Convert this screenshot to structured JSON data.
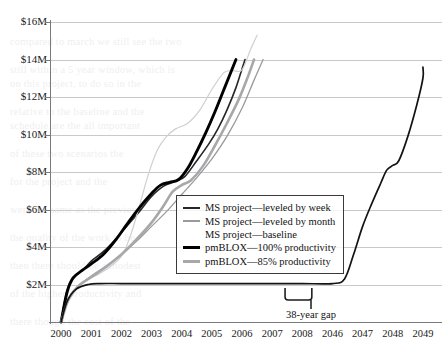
{
  "chart_data": {
    "type": "line",
    "title": "",
    "subtitle": "",
    "xlabel": "",
    "ylabel": "",
    "grid": true,
    "legend_position": "center-right-inside",
    "xlim": [
      2000,
      2049
    ],
    "ylim": [
      0,
      16
    ],
    "y_unit": "millions of dollars",
    "x_tick_labels": [
      "2000",
      "2001",
      "2002",
      "2003",
      "2004",
      "2005",
      "2006",
      "2007",
      "2008",
      "2046",
      "2047",
      "2048",
      "2049"
    ],
    "y_tick_labels": [
      "$16M",
      "$14M",
      "$12M",
      "$10M",
      "$8M",
      "$6M",
      "$4M",
      "$2M"
    ],
    "y_tick_values": [
      16,
      14,
      12,
      10,
      8,
      6,
      4,
      2
    ],
    "axis_break": {
      "label": "38-year gap",
      "between": [
        "2008",
        "2046"
      ],
      "years": 38
    },
    "series": [
      {
        "name": "MS project—leveled by week",
        "color": "#262626",
        "width": 1.6,
        "points": [
          [
            2000.0,
            0.0
          ],
          [
            2000.15,
            1.35
          ],
          [
            2000.3,
            2.1
          ],
          [
            2000.5,
            2.5
          ],
          [
            2000.8,
            2.9
          ],
          [
            2001.0,
            3.25
          ],
          [
            2001.4,
            3.75
          ],
          [
            2001.8,
            4.4
          ],
          [
            2002.2,
            5.15
          ],
          [
            2002.6,
            5.9
          ],
          [
            2003.0,
            6.7
          ],
          [
            2003.4,
            7.25
          ],
          [
            2003.8,
            7.5
          ],
          [
            2004.1,
            7.75
          ],
          [
            2004.5,
            8.6
          ],
          [
            2004.9,
            9.5
          ],
          [
            2005.2,
            10.3
          ],
          [
            2005.5,
            11.3
          ],
          [
            2005.8,
            12.5
          ],
          [
            2006.0,
            13.5
          ],
          [
            2006.1,
            14.0
          ]
        ]
      },
      {
        "name": "MS project—leveled by month",
        "color": "#9a9a9d",
        "width": 1.3,
        "points": [
          [
            2000.0,
            0.0
          ],
          [
            2000.2,
            1.1
          ],
          [
            2000.5,
            1.8
          ],
          [
            2001.0,
            2.45
          ],
          [
            2001.5,
            3.0
          ],
          [
            2002.0,
            3.6
          ],
          [
            2002.5,
            4.3
          ],
          [
            2003.0,
            5.1
          ],
          [
            2003.5,
            5.9
          ],
          [
            2004.0,
            6.8
          ],
          [
            2004.5,
            7.7
          ],
          [
            2005.0,
            8.7
          ],
          [
            2005.5,
            9.9
          ],
          [
            2006.0,
            11.4
          ],
          [
            2006.4,
            12.9
          ],
          [
            2006.7,
            14.0
          ]
        ]
      },
      {
        "name": "MS project—baseline",
        "color": "#cfcfd2",
        "width": 1.2,
        "points": [
          [
            2000.0,
            0.0
          ],
          [
            2000.25,
            1.3
          ],
          [
            2000.6,
            2.0
          ],
          [
            2001.0,
            2.35
          ],
          [
            2001.5,
            2.8
          ],
          [
            2002.0,
            3.5
          ],
          [
            2002.3,
            4.6
          ],
          [
            2002.6,
            6.2
          ],
          [
            2002.9,
            7.9
          ],
          [
            2003.2,
            9.2
          ],
          [
            2003.5,
            9.9
          ],
          [
            2003.8,
            10.3
          ],
          [
            2004.2,
            10.6
          ],
          [
            2004.6,
            11.3
          ],
          [
            2005.0,
            12.4
          ],
          [
            2005.4,
            13.3
          ],
          [
            2005.7,
            13.4
          ],
          [
            2006.0,
            13.45
          ],
          [
            2006.3,
            14.6
          ],
          [
            2006.5,
            15.3
          ]
        ]
      },
      {
        "name": "pmBLOX—100% productivity",
        "color": "#000000",
        "width": 2.9,
        "points": [
          [
            2000.0,
            0.0
          ],
          [
            2000.2,
            1.6
          ],
          [
            2000.4,
            2.35
          ],
          [
            2000.7,
            2.75
          ],
          [
            2001.0,
            3.1
          ],
          [
            2001.4,
            3.6
          ],
          [
            2001.8,
            4.35
          ],
          [
            2002.2,
            5.25
          ],
          [
            2002.6,
            6.1
          ],
          [
            2003.0,
            6.85
          ],
          [
            2003.3,
            7.3
          ],
          [
            2003.6,
            7.45
          ],
          [
            2003.9,
            7.6
          ],
          [
            2004.2,
            8.2
          ],
          [
            2004.5,
            9.1
          ],
          [
            2004.8,
            10.1
          ],
          [
            2005.1,
            11.2
          ],
          [
            2005.4,
            12.4
          ],
          [
            2005.65,
            13.4
          ],
          [
            2005.8,
            14.0
          ]
        ]
      },
      {
        "name": "pmBLOX—85% productivity",
        "color": "#a8a8ab",
        "width": 2.6,
        "points": [
          [
            2000.0,
            0.0
          ],
          [
            2000.25,
            1.2
          ],
          [
            2000.6,
            1.95
          ],
          [
            2001.0,
            2.4
          ],
          [
            2001.5,
            2.95
          ],
          [
            2002.0,
            3.6
          ],
          [
            2002.5,
            4.4
          ],
          [
            2003.0,
            5.3
          ],
          [
            2003.4,
            6.2
          ],
          [
            2003.7,
            6.95
          ],
          [
            2004.0,
            7.3
          ],
          [
            2004.3,
            7.55
          ],
          [
            2004.7,
            8.3
          ],
          [
            2005.1,
            9.4
          ],
          [
            2005.5,
            10.6
          ],
          [
            2005.9,
            11.9
          ],
          [
            2006.2,
            13.1
          ],
          [
            2006.4,
            14.0
          ]
        ]
      },
      {
        "name": "MS project—baseline (flat-then-late)",
        "color": "#131313",
        "width": 1.7,
        "points": [
          [
            2000.0,
            0.0
          ],
          [
            2000.2,
            1.1
          ],
          [
            2000.5,
            1.75
          ],
          [
            2000.9,
            2.0
          ],
          [
            2001.3,
            2.05
          ],
          [
            2002.0,
            2.05
          ],
          [
            2003.0,
            2.05
          ],
          [
            2004.0,
            2.05
          ],
          [
            2005.0,
            2.05
          ],
          [
            2006.0,
            2.05
          ],
          [
            2007.0,
            2.05
          ],
          [
            2008.0,
            2.05
          ],
          [
            2046.0,
            2.05
          ],
          [
            2046.4,
            2.3
          ],
          [
            2046.7,
            3.6
          ],
          [
            2047.0,
            5.1
          ],
          [
            2047.3,
            6.3
          ],
          [
            2047.6,
            7.4
          ],
          [
            2047.8,
            8.1
          ],
          [
            2048.0,
            8.35
          ],
          [
            2048.2,
            8.6
          ],
          [
            2048.5,
            9.9
          ],
          [
            2048.8,
            11.6
          ],
          [
            2049.1,
            13.0
          ],
          [
            2049.3,
            13.6
          ]
        ]
      }
    ]
  },
  "legend": {
    "items": [
      {
        "label": "MS project—leveled by week",
        "color": "#262626",
        "thickness": 1.8,
        "swatch": true
      },
      {
        "label": "MS project—leveled by month",
        "color": "#9a9a9d",
        "thickness": 1.2,
        "swatch": true
      },
      {
        "label": "MS project—baseline",
        "color": "#e2e2e4",
        "thickness": 1.0,
        "swatch": false
      },
      {
        "label": "pmBLOX—100% productivity",
        "color": "#000000",
        "thickness": 3.0,
        "swatch": true
      },
      {
        "label": "pmBLOX—85% productivity",
        "color": "#a8a8ab",
        "thickness": 2.8,
        "swatch": true
      }
    ]
  },
  "annotations": {
    "gap_label": "38-year gap"
  },
  "ghost_text": [
    "",
    "",
    "compared to march we still see the two",
    "",
    "still within a 5 year window, which is",
    "on this project, to do so in the",
    "",
    "relative to the baseline and the",
    "schedule are the all important",
    "",
    "of these two scenarios the",
    "",
    "for the project and the",
    "",
    "were the same as the previous",
    "",
    "the quality of the work to be",
    "",
    "then there should be a modest",
    "",
    "of the higher productivity and",
    "",
    "there though the cost of the",
    "",
    "",
    ""
  ]
}
